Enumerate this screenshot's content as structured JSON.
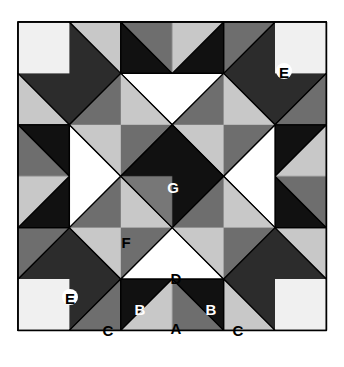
{
  "diagram": {
    "grid_units": 6,
    "colors": {
      "gray_fabric": "#a8a8a8",
      "black_fabric": "#1a1a1a",
      "white_fabric": "#ffffff",
      "checker_dark": "#3a3a3a",
      "checker_light": "#e8e8e8",
      "outline": "#000000"
    },
    "labels": {
      "A": "A",
      "B_left": "B",
      "B_right": "B",
      "C_left": "C",
      "C_right": "C",
      "D": "D",
      "E_top": "E",
      "E_bottom": "E",
      "F": "F",
      "G": "G"
    },
    "pieces": [
      {
        "label": "A",
        "description": "gray triangle, bottom-center flying geese"
      },
      {
        "label": "B",
        "description": "black triangles flanking A"
      },
      {
        "label": "C",
        "description": "gray corner triangles"
      },
      {
        "label": "D",
        "description": "white triangle"
      },
      {
        "label": "E",
        "description": "patterned corner pentagon"
      },
      {
        "label": "F",
        "description": "gray square on point"
      },
      {
        "label": "G",
        "description": "black center square on point"
      }
    ]
  }
}
